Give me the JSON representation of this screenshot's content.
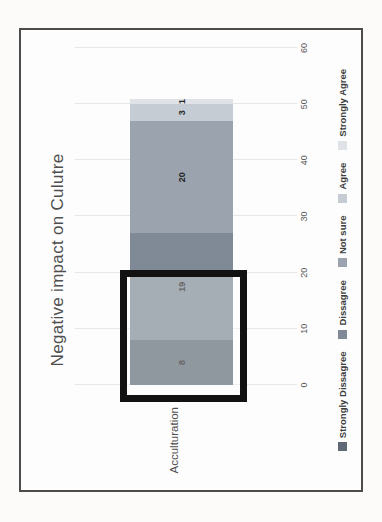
{
  "chart_data": {
    "type": "bar",
    "variant": "stacked-horizontal",
    "presentation": "photo of chart rotated 90 degrees counter-clockwise",
    "title": "Negative impact on Culutre",
    "categories": [
      "Acculturation"
    ],
    "series": [
      {
        "name": "Strongly Dissagree",
        "values": [
          8
        ],
        "color": "#5f6a76"
      },
      {
        "name": "Dissagree",
        "values": [
          19
        ],
        "color": "#7f8a96"
      },
      {
        "name": "Not sure",
        "values": [
          20
        ],
        "color": "#9aa3ae"
      },
      {
        "name": "Agree",
        "values": [
          3
        ],
        "color": "#c6ccd4"
      },
      {
        "name": "Strongly Agree",
        "values": [
          1
        ],
        "color": "#dfe2e7"
      }
    ],
    "data_labels": [
      "8",
      "19",
      "20",
      "3",
      "1"
    ],
    "value_axis": {
      "min": 0,
      "max": 60,
      "tick_step": 10,
      "tick_labels": [
        "0",
        "10",
        "20",
        "30",
        "40",
        "50",
        "60"
      ]
    },
    "grid": true,
    "legend_position": "bottom",
    "annotation": {
      "kind": "highlight-rectangle",
      "description": "thick black rectangle with translucent white fill over the first two segments",
      "value_range": [
        -3,
        20.5
      ],
      "stroke_color": "#121212"
    }
  },
  "colors": {
    "frame_border": "#4c4c4c",
    "gridline": "#e7e7e7",
    "title_text": "#4f4f4f",
    "tick_text": "#595959",
    "legend_text": "#3d3d3d",
    "data_label_text": "#262626",
    "background": "#fcfbfa"
  }
}
